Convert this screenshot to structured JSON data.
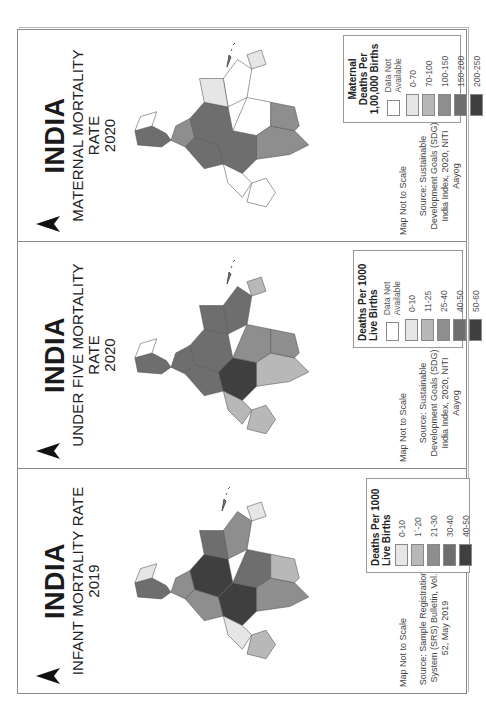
{
  "panels": [
    {
      "id": "infant-mortality",
      "country": "INDIA",
      "metric": "INFANT MORTALITY RATE",
      "year": "2019",
      "north_label": "N",
      "scale_note": "Map Not to Scale",
      "source": "Source: Sample Registration System (SRS) Bulletin, Vol. 52, May 2019",
      "legend": {
        "title": "Deaths Per 1000 Live Births",
        "items": [
          {
            "label": "0-10",
            "color": "#e6e6e6"
          },
          {
            "label": "1`-20",
            "color": "#b8b8b8"
          },
          {
            "label": "21-30",
            "color": "#8e8e8e"
          },
          {
            "label": "30-40",
            "color": "#6e6e6e"
          },
          {
            "label": "40-50",
            "color": "#3f3f3f"
          }
        ]
      }
    },
    {
      "id": "under-five-mortality",
      "country": "INDIA",
      "metric": "UNDER FIVE MORTALITY RATE",
      "year": "2020",
      "north_label": "N",
      "scale_note": "Map Not to Scale",
      "source": "Source: Sustainable Development Goals (SDG) India Index, 2020, NITI Aayog",
      "legend": {
        "title": "Deaths Per 1000 Live Births",
        "items": [
          {
            "label": "Data Not Available",
            "color": "#ffffff"
          },
          {
            "label": "0-10",
            "color": "#e6e6e6"
          },
          {
            "label": "11-25",
            "color": "#b8b8b8"
          },
          {
            "label": "25-40",
            "color": "#8e8e8e"
          },
          {
            "label": "40-50",
            "color": "#6e6e6e"
          },
          {
            "label": "50-60",
            "color": "#3f3f3f"
          }
        ]
      }
    },
    {
      "id": "maternal-mortality",
      "country": "INDIA",
      "metric": "MATERNAL MORTALITY RATE",
      "year": "2020",
      "north_label": "N",
      "scale_note": "Map Not to Scale",
      "source": "Source: Sustainable Development Goals (SDG) India Index, 2020, NITI Aayog",
      "legend": {
        "title": "Maternal Deaths Per 1,00,000 Births",
        "items": [
          {
            "label": "Data Not Available",
            "color": "#ffffff"
          },
          {
            "label": "0-70",
            "color": "#e6e6e6"
          },
          {
            "label": "70-100",
            "color": "#b8b8b8"
          },
          {
            "label": "100-150",
            "color": "#8e8e8e"
          },
          {
            "label": "150-200",
            "color": "#6e6e6e"
          },
          {
            "label": "200-250",
            "color": "#3f3f3f"
          }
        ]
      }
    }
  ]
}
